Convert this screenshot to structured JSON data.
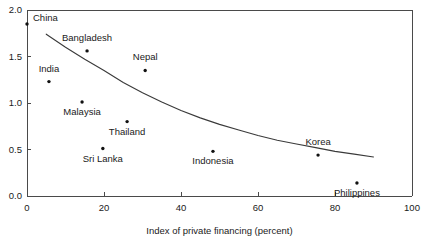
{
  "chart_data": {
    "type": "scatter",
    "title": "",
    "xlabel": "Index of private financing (percent)",
    "ylabel": "",
    "xlim": [
      0,
      100
    ],
    "ylim": [
      0,
      2.0
    ],
    "grid": false,
    "legend": "none",
    "xticks": [
      0,
      20,
      40,
      60,
      80,
      100
    ],
    "xtick_labels": [
      "0",
      "20",
      "40",
      "60",
      "80",
      "100"
    ],
    "yticks": [
      0.0,
      0.5,
      1.0,
      1.5,
      2.0
    ],
    "ytick_labels": [
      "0.0",
      "0.5",
      "1.0",
      "1.5",
      "2.0"
    ],
    "points": [
      {
        "label": "China",
        "x": 0.0,
        "y": 1.85,
        "label_dx": 6,
        "label_dy": -3
      },
      {
        "label": "Bangladesh",
        "x": 15.6,
        "y": 1.56,
        "label_dx": 0,
        "label_dy": -10
      },
      {
        "label": "Nepal",
        "x": 30.7,
        "y": 1.35,
        "label_dx": 0,
        "label_dy": -10
      },
      {
        "label": "India",
        "x": 5.7,
        "y": 1.23,
        "label_dx": 0,
        "label_dy": -10
      },
      {
        "label": "Malaysia",
        "x": 14.3,
        "y": 1.01,
        "label_dx": 0,
        "label_dy": 13
      },
      {
        "label": "Thailand",
        "x": 26.0,
        "y": 0.8,
        "label_dx": 0,
        "label_dy": 13
      },
      {
        "label": "Sri Lanka",
        "x": 19.7,
        "y": 0.51,
        "label_dx": 0,
        "label_dy": 13
      },
      {
        "label": "Indonesia",
        "x": 48.3,
        "y": 0.48,
        "label_dx": 0,
        "label_dy": 13
      },
      {
        "label": "Korea",
        "x": 75.6,
        "y": 0.44,
        "label_dx": 0,
        "label_dy": -10
      },
      {
        "label": "Philippines",
        "x": 85.7,
        "y": 0.14,
        "label_dx": 0,
        "label_dy": 13
      }
    ],
    "fit_curve": {
      "name": "trend-line",
      "x": [
        5,
        10,
        15,
        20,
        25,
        30,
        35,
        40,
        45,
        50,
        55,
        60,
        65,
        70,
        75,
        80,
        85,
        90
      ],
      "y": [
        1.74,
        1.6,
        1.47,
        1.35,
        1.22,
        1.11,
        1.01,
        0.92,
        0.84,
        0.77,
        0.71,
        0.65,
        0.6,
        0.56,
        0.52,
        0.48,
        0.45,
        0.42
      ]
    }
  },
  "colors": {
    "axis": "#4a4a4a",
    "marker": "#111111",
    "curve": "#3a3a3a",
    "text": "#1a1a1a",
    "background": "#ffffff"
  }
}
